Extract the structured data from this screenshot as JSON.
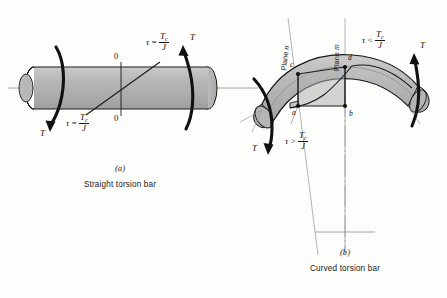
{
  "figure": {
    "panels": [
      {
        "id": "a",
        "letter": "(a)",
        "caption": "Straight torsion bar",
        "torque_left_label": "T",
        "torque_right_label": "T",
        "neutral_labels": [
          "0",
          "0"
        ],
        "stress_top": {
          "tau": "τ",
          "relation": "=",
          "num": "T",
          "num_sub": "c",
          "den": "J"
        },
        "stress_bottom": {
          "tau": "τ",
          "relation": "=",
          "num": "T",
          "num_sub": "c",
          "den": "J"
        }
      },
      {
        "id": "b",
        "letter": "(b)",
        "caption": "Curved torsion bar",
        "torque_left_label": "T",
        "torque_right_label": "T",
        "plane_n_label": "Plane",
        "plane_n_symbol": "n",
        "plane_m_label": "Plane",
        "plane_m_symbol": "m",
        "points": [
          "a",
          "b",
          "c",
          "d"
        ],
        "stress_outer": {
          "tau": "τ",
          "relation": "<",
          "num": "T",
          "num_sub": "c",
          "den": "J"
        },
        "stress_inner": {
          "tau": "τ",
          "relation": ">",
          "num": "T",
          "num_sub": "c",
          "den": "J"
        }
      }
    ]
  },
  "colors": {
    "background": "#fdfdfb",
    "bar_fill": "#b4b4b4",
    "bar_fill_light": "#c6c6c6",
    "bar_fill_dark": "#a2a2a2",
    "outline": "#1a1a1a",
    "centerline": "#8e8e8e",
    "arrow": "#111111"
  }
}
